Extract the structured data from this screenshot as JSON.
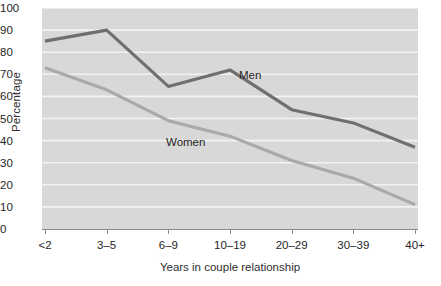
{
  "chart_data": {
    "type": "line",
    "title": "",
    "subtitle": "",
    "xlabel": "Years in couple relationship",
    "ylabel": "Percentage",
    "categories": [
      "<2",
      "3–5",
      "6–9",
      "10–19",
      "20–29",
      "30–39",
      "40+"
    ],
    "ylim": [
      0,
      100
    ],
    "ytick_labels": [
      "100",
      "90",
      "80",
      "70",
      "60",
      "50",
      "40",
      "30",
      "20",
      "10",
      "0"
    ],
    "ytick_values": [
      100,
      90,
      80,
      70,
      60,
      50,
      40,
      30,
      20,
      10,
      0
    ],
    "grid": true,
    "grid_axis": "y",
    "legend_position": "inline-annotation",
    "plot_background": "#d8d8d8",
    "series": [
      {
        "name": "Men",
        "color": "#6f6f6f",
        "label_x_category": "10–19",
        "values": [
          85,
          90,
          64.5,
          72,
          54,
          48,
          37
        ]
      },
      {
        "name": "Women",
        "color": "#a9a9a9",
        "label_x_category": "6–9",
        "values": [
          73,
          63,
          49,
          42,
          31,
          23,
          11
        ]
      }
    ],
    "annotations": [
      {
        "text": "Men",
        "series": "Men"
      },
      {
        "text": "Women",
        "series": "Women"
      }
    ]
  }
}
